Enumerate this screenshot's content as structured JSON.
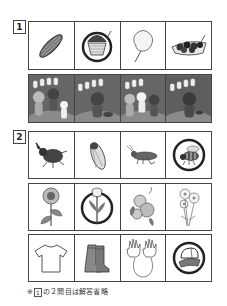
{
  "section1": {
    "number": "1",
    "row1": [
      {
        "item": "grilled-corn"
      },
      {
        "item": "shaved-ice"
      },
      {
        "item": "cotton-candy"
      },
      {
        "item": "takoyaki"
      }
    ],
    "row2": [
      {
        "scene": "bear-raccoon-rabbit-at-festival"
      },
      {
        "scene": "raccoon-dancing"
      },
      {
        "scene": "bear-rabbit-raccoon-group"
      },
      {
        "scene": "raccoon-alone"
      }
    ]
  },
  "section2": {
    "number": "2",
    "row1": [
      {
        "item": "rhinoceros-beetle"
      },
      {
        "item": "cicada"
      },
      {
        "item": "grasshopper"
      },
      {
        "item": "bee-circled"
      }
    ],
    "row2": [
      {
        "item": "sunflower"
      },
      {
        "item": "tulip-circled"
      },
      {
        "item": "morning-glory"
      },
      {
        "item": "cosmos"
      }
    ],
    "row3": [
      {
        "item": "t-shirt"
      },
      {
        "item": "rain-boots"
      },
      {
        "item": "gloves"
      },
      {
        "item": "hat-circled"
      }
    ]
  },
  "footnote": {
    "prefix": "※",
    "boxed_number": "1",
    "text": "の２問目は解答省略"
  },
  "colors": {
    "border": "#444444",
    "dark_panel": "#6b6b6b",
    "text": "#222222"
  }
}
